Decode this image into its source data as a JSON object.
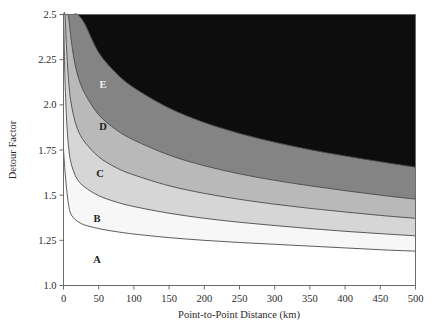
{
  "chart_data": {
    "type": "area",
    "title": "",
    "xlabel": "Point-to-Point Distance (km)",
    "ylabel": "Detour Factor",
    "xlim": [
      0,
      500
    ],
    "ylim": [
      1.0,
      2.5
    ],
    "xticks": [
      0,
      50,
      100,
      150,
      200,
      250,
      300,
      350,
      400,
      450,
      500
    ],
    "xtick_labels": [
      "0",
      "50",
      "100",
      "150",
      "200",
      "250",
      "300",
      "350",
      "400",
      "450",
      "500"
    ],
    "yticks": [
      1.0,
      1.25,
      1.5,
      1.75,
      2.0,
      2.25,
      2.5
    ],
    "ytick_labels": [
      "1.0",
      "1.25",
      "1.5",
      "1.75",
      "2.0",
      "2.25",
      "2.5"
    ],
    "grid": false,
    "legend_position": "inline-band-labels",
    "bands": [
      {
        "name": "A",
        "label": "A",
        "fill": "#ffffff",
        "label_x": 97,
        "label_y": 1.145,
        "upper_boundary": {
          "x": [
            0,
            2,
            4,
            6,
            8,
            10,
            14,
            20,
            30,
            50,
            75,
            100,
            150,
            200,
            250,
            300,
            350,
            400,
            450,
            500
          ],
          "y": [
            1.75,
            1.64,
            1.55,
            1.48,
            1.43,
            1.4,
            1.375,
            1.355,
            1.335,
            1.315,
            1.298,
            1.285,
            1.265,
            1.25,
            1.238,
            1.228,
            1.218,
            1.208,
            1.198,
            1.19
          ]
        }
      },
      {
        "name": "B",
        "label": "B",
        "fill": "#f7f7f7",
        "label_x": 97,
        "label_y": 1.375,
        "upper_boundary": {
          "x": [
            0,
            2,
            4,
            6,
            8,
            10,
            14,
            20,
            30,
            50,
            75,
            100,
            150,
            200,
            250,
            300,
            350,
            400,
            450,
            500
          ],
          "y": [
            2.5,
            2.16,
            1.95,
            1.82,
            1.74,
            1.69,
            1.635,
            1.585,
            1.545,
            1.497,
            1.462,
            1.437,
            1.4,
            1.372,
            1.35,
            1.332,
            1.315,
            1.3,
            1.287,
            1.275
          ]
        }
      },
      {
        "name": "C",
        "label": "C",
        "fill": "#d6d6d6",
        "label_x": 100,
        "label_y": 1.625,
        "upper_boundary": {
          "x": [
            0,
            2,
            4,
            6,
            8,
            10,
            14,
            20,
            30,
            50,
            75,
            100,
            150,
            200,
            250,
            300,
            350,
            400,
            450,
            500
          ],
          "y": [
            2.5,
            2.5,
            2.34,
            2.2,
            2.1,
            2.03,
            1.945,
            1.865,
            1.795,
            1.712,
            1.652,
            1.612,
            1.552,
            1.51,
            1.477,
            1.45,
            1.427,
            1.407,
            1.388,
            1.372
          ]
        }
      },
      {
        "name": "D",
        "label": "D",
        "fill": "#b9b9b9",
        "label_x": 103,
        "label_y": 1.885,
        "upper_boundary": {
          "x": [
            0,
            2,
            4,
            6,
            8,
            10,
            14,
            20,
            30,
            50,
            75,
            100,
            150,
            200,
            250,
            300,
            350,
            400,
            450,
            500
          ],
          "y": [
            2.5,
            2.5,
            2.5,
            2.5,
            2.46,
            2.39,
            2.275,
            2.165,
            2.065,
            1.945,
            1.862,
            1.805,
            1.722,
            1.663,
            1.618,
            1.582,
            1.552,
            1.525,
            1.5,
            1.478
          ]
        }
      },
      {
        "name": "E",
        "label": "E",
        "fill": "#848484",
        "label_x": 103,
        "label_y": 2.115,
        "upper_boundary": {
          "x": [
            0,
            2,
            4,
            6,
            8,
            10,
            14,
            20,
            30,
            50,
            75,
            100,
            150,
            200,
            250,
            300,
            350,
            400,
            450,
            500
          ],
          "y": [
            2.5,
            2.5,
            2.5,
            2.5,
            2.5,
            2.5,
            2.5,
            2.5,
            2.45,
            2.29,
            2.175,
            2.095,
            1.982,
            1.902,
            1.842,
            1.793,
            1.752,
            1.717,
            1.685,
            1.655
          ]
        }
      },
      {
        "name": "F",
        "label": "",
        "fill": "#0d0d0d",
        "label_x": null,
        "label_y": null,
        "upper_boundary": {
          "x": [
            0,
            500
          ],
          "y": [
            2.5,
            2.5
          ]
        }
      }
    ],
    "colors": {
      "band_a": "#ffffff",
      "band_b": "#f7f7f7",
      "band_c": "#d6d6d6",
      "band_d": "#b9b9b9",
      "band_e": "#848484",
      "beyond_e": "#0d0d0d",
      "axis": "#6b6b6b",
      "curve": "#4a4a4a",
      "text": "#2b2b2b"
    }
  }
}
